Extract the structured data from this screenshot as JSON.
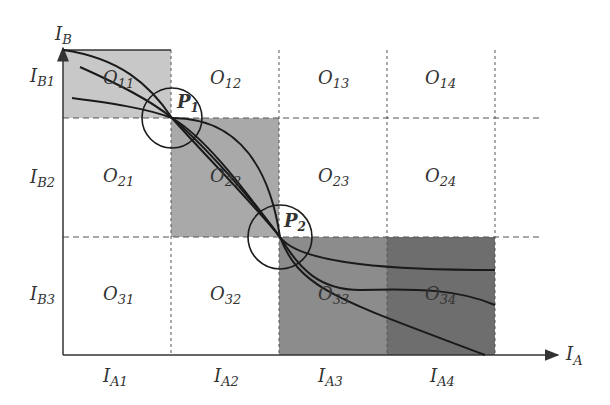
{
  "axes": {
    "x_label": "I",
    "x_sub": "A",
    "y_label": "I",
    "y_sub": "B"
  },
  "columns": [
    {
      "label": "I",
      "sub": "A1"
    },
    {
      "label": "I",
      "sub": "A2"
    },
    {
      "label": "I",
      "sub": "A3"
    },
    {
      "label": "I",
      "sub": "A4"
    }
  ],
  "rows": [
    {
      "label": "I",
      "sub": "B1"
    },
    {
      "label": "I",
      "sub": "B2"
    },
    {
      "label": "I",
      "sub": "B3"
    }
  ],
  "cells": [
    {
      "label": "O",
      "sub": "11",
      "shade": "#c8c8c8"
    },
    {
      "label": "O",
      "sub": "12",
      "shade": "none"
    },
    {
      "label": "O",
      "sub": "13",
      "shade": "none"
    },
    {
      "label": "O",
      "sub": "14",
      "shade": "none"
    },
    {
      "label": "O",
      "sub": "21",
      "shade": "none"
    },
    {
      "label": "O",
      "sub": "22",
      "shade": "#a9a9a9"
    },
    {
      "label": "O",
      "sub": "23",
      "shade": "none"
    },
    {
      "label": "O",
      "sub": "24",
      "shade": "none"
    },
    {
      "label": "O",
      "sub": "31",
      "shade": "none"
    },
    {
      "label": "O",
      "sub": "32",
      "shade": "none"
    },
    {
      "label": "O",
      "sub": "33",
      "shade": "#8c8c8c"
    },
    {
      "label": "O",
      "sub": "34",
      "shade": "#6e6e6e"
    }
  ],
  "points": [
    {
      "label": "P",
      "sub": "1"
    },
    {
      "label": "P",
      "sub": "2"
    }
  ]
}
